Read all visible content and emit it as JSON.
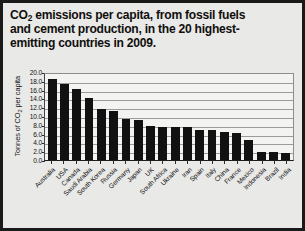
{
  "figure": {
    "title_line1_prefix": "CO",
    "title_line1_sub": "2",
    "title_line1_rest": " emissions per capita, from fossil fuels",
    "title_line2": "and cement production, in the 20 highest-",
    "title_line3": "emitting countries in 2009.",
    "title_plain": "CO2 emissions per capita, from fossil fuels and cement production, in the 20 highest-emitting countries in 2009.",
    "border_color": "#1a1a1a",
    "background_color": "#e9e9e7",
    "plot_background_color": "#f3f3f1",
    "bar_color": "#111111",
    "gridline_color": "#9b9b9b"
  },
  "chart_data": {
    "type": "bar",
    "xlabel": "",
    "ylabel_prefix": "Tonnes of CO",
    "ylabel_sub": "2",
    "ylabel_suffix": " per capita",
    "ylabel": "Tonnes of CO2 per capita",
    "ylim": [
      0.0,
      20.0
    ],
    "ytick_step": 2.0,
    "ytick_labels": [
      "20.0",
      "18.0",
      "16.0",
      "14.0",
      "12.0",
      "10.0",
      "8.0",
      "6.0",
      "4.0",
      "2.0",
      "0.0"
    ],
    "ytick_values": [
      20.0,
      18.0,
      16.0,
      14.0,
      12.0,
      10.0,
      8.0,
      6.0,
      4.0,
      2.0,
      0.0
    ],
    "grid": true,
    "grid_axis": "y",
    "legend": false,
    "legend_position": "none",
    "categories": [
      "Australia",
      "USA",
      "Canada",
      "Saudi Arabia",
      "South Korea",
      "Russia",
      "Germany",
      "Japan",
      "UK",
      "South Africa",
      "Ukraine",
      "Iran",
      "Spain",
      "Italy",
      "China",
      "France",
      "Mexico",
      "Indonesia",
      "Brazil",
      "India"
    ],
    "values": [
      18.3,
      17.2,
      16.2,
      14.0,
      11.5,
      11.2,
      9.3,
      9.1,
      7.8,
      7.6,
      7.6,
      7.5,
      6.9,
      6.8,
      6.3,
      6.2,
      4.5,
      1.9,
      1.9,
      1.5
    ]
  }
}
